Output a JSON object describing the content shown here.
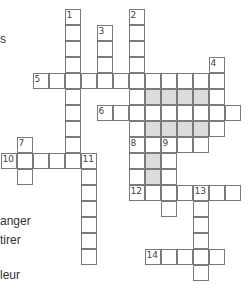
{
  "puzzle": {
    "cell_size": 16,
    "origin": {
      "x": 1,
      "y": 9
    },
    "colors": {
      "border": "#7a7a7a",
      "shaded": "#dcdcdc",
      "cell": "#ffffff"
    },
    "words": [
      {
        "num": "1",
        "dir": "down",
        "row": 0,
        "col": 4,
        "len": 10
      },
      {
        "num": "2",
        "dir": "down",
        "row": 0,
        "col": 8,
        "len": 8
      },
      {
        "num": "3",
        "dir": "down",
        "row": 1,
        "col": 6,
        "len": 4
      },
      {
        "num": "4",
        "dir": "down",
        "row": 3,
        "col": 13,
        "len": 5
      },
      {
        "num": "5",
        "dir": "across",
        "row": 4,
        "col": 2,
        "len": 12
      },
      {
        "num": "6",
        "dir": "across",
        "row": 6,
        "col": 6,
        "len": 9
      },
      {
        "num": "7",
        "dir": "down",
        "row": 8,
        "col": 1,
        "len": 3
      },
      {
        "num": "8",
        "dir": "across",
        "row": 8,
        "col": 8,
        "len": 5
      },
      {
        "num": "8",
        "dir": "down",
        "row": 8,
        "col": 8,
        "len": 4
      },
      {
        "num": "9",
        "dir": "down",
        "row": 8,
        "col": 10,
        "len": 5
      },
      {
        "num": "10",
        "dir": "across",
        "row": 9,
        "col": 0,
        "len": 6
      },
      {
        "num": "11",
        "dir": "down",
        "row": 9,
        "col": 5,
        "len": 7
      },
      {
        "num": "12",
        "dir": "across",
        "row": 11,
        "col": 8,
        "len": 7
      },
      {
        "num": "13",
        "dir": "down",
        "row": 11,
        "col": 12,
        "len": 6
      },
      {
        "num": "14",
        "dir": "across",
        "row": 15,
        "col": 9,
        "len": 5
      }
    ],
    "shaded": [
      [
        5,
        9
      ],
      [
        5,
        10
      ],
      [
        5,
        11
      ],
      [
        5,
        12
      ],
      [
        7,
        9
      ],
      [
        7,
        10
      ],
      [
        7,
        11
      ],
      [
        7,
        12
      ],
      [
        9,
        9
      ],
      [
        10,
        9
      ]
    ]
  },
  "clue_fragments": [
    {
      "text": "s",
      "x": 0,
      "y": 32
    },
    {
      "text": "anger",
      "x": 0,
      "y": 214
    },
    {
      "text": "tirer",
      "x": 0,
      "y": 233
    },
    {
      "text": "leur",
      "x": 0,
      "y": 268
    }
  ]
}
